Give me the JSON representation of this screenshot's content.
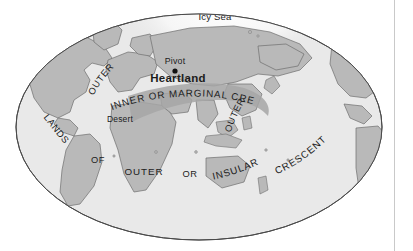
{
  "figure": {
    "name": "mackinder-heartland-map",
    "projection": "elliptical world map"
  },
  "colors": {
    "ocean": "#e9e9e9",
    "land": "#b9b9b9",
    "inner_crescent_band": "#a6a6a6",
    "icy_sea_highlight": "#fbfbfb",
    "outline": "#6e6e6e",
    "ellipse_border": "#4a4a4a",
    "label": "#1c1c1c",
    "page_background": "#ffffff",
    "rule": "#c9c9c9"
  },
  "labels": {
    "icy_sea": "Icy Sea",
    "pivot": "Pivot",
    "heartland": "Heartland",
    "desert": "Desert",
    "outer_europe": "OUTER",
    "inner_or_marginal_crescent": "INNER OR MARGINAL CRESCENT",
    "outer_east_asia": "OUTER",
    "lands": "LANDS",
    "of": "OF",
    "outer_africa": "OUTER",
    "or": "OR",
    "insular": "INSULAR",
    "crescent_right": "CRESCENT"
  },
  "markers": {
    "pivot_point": "pivot-dot"
  }
}
